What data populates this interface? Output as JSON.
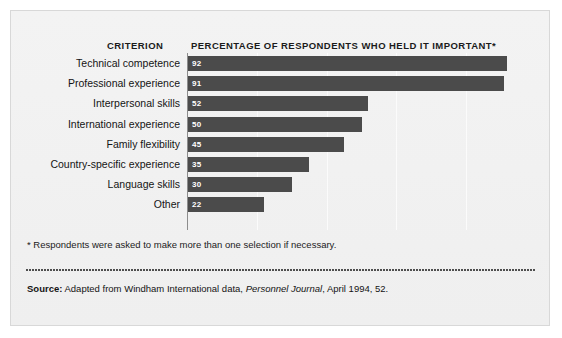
{
  "figure": {
    "column_header_criterion": "CRITERION",
    "column_header_percentage": "PERCENTAGE OF RESPONDENTS WHO HELD IT IMPORTANT*",
    "footnote": "* Respondents were asked to make more than one selection if necessary.",
    "source_label": "Source:",
    "source_text_before": " Adapted from Windham International data, ",
    "source_journal": "Personnel Journal",
    "source_text_after": ", April 1994, 52.",
    "bar_color": "#4b4b4b",
    "panel_background": "#f1f1f1",
    "border_color": "#d8d8d8",
    "value_label_color": "#ffffff"
  },
  "chart_data": {
    "type": "bar",
    "orientation": "horizontal",
    "title": "PERCENTAGE OF RESPONDENTS WHO HELD IT IMPORTANT*",
    "xlabel": "",
    "ylabel": "CRITERION",
    "categories": [
      "Technical competence",
      "Professional experience",
      "Interpersonal skills",
      "International experience",
      "Family flexibility",
      "Country-specific experience",
      "Language skills",
      "Other"
    ],
    "values": [
      92,
      91,
      52,
      50,
      45,
      35,
      30,
      22
    ],
    "value_labels": [
      "92",
      "91",
      "52",
      "50",
      "45",
      "35",
      "30",
      "22"
    ],
    "xlim": [
      0,
      95
    ],
    "grid": true,
    "gridlines": [
      20,
      40,
      60,
      80
    ],
    "legend": false,
    "annotations": [
      "* Respondents were asked to make more than one selection if necessary."
    ]
  }
}
